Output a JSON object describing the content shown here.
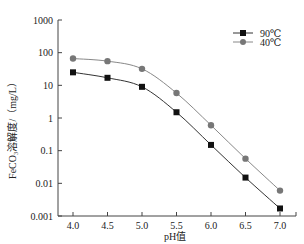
{
  "chart_data": {
    "type": "line",
    "title": "",
    "xlabel": "pH值",
    "ylabel": "FeCO₃溶解度/（mg/L）",
    "yscale": "log",
    "ylim": [
      0.001,
      1000
    ],
    "xlim": [
      3.75,
      7.25
    ],
    "x": [
      4.0,
      4.5,
      5.0,
      5.5,
      6.0,
      6.5,
      7.0
    ],
    "x_tick_labels": [
      "4.0",
      "4.5",
      "5.0",
      "5.5",
      "6.0",
      "6.5",
      "7.0"
    ],
    "y_ticks": [
      0.001,
      0.01,
      0.1,
      1,
      10,
      100,
      1000
    ],
    "y_tick_labels": [
      "0.001",
      "0.01",
      "0.1",
      "1",
      "10",
      "100",
      "1000"
    ],
    "grid": false,
    "legend_position": "upper right",
    "series": [
      {
        "name": "90℃",
        "marker": "square",
        "color": "#111111",
        "values": [
          25,
          17,
          9,
          1.5,
          0.15,
          0.015,
          0.0017
        ]
      },
      {
        "name": "40℃",
        "marker": "circle",
        "color": "#777777",
        "values": [
          66,
          55,
          32,
          5.8,
          0.6,
          0.057,
          0.006
        ]
      }
    ]
  }
}
